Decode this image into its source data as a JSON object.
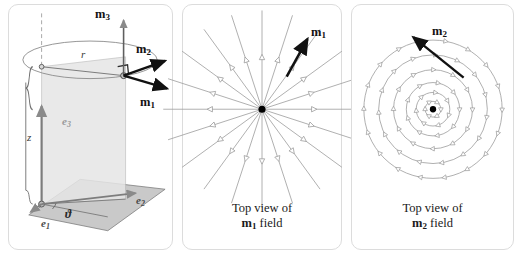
{
  "figure": {
    "background": "#ffffff",
    "panel_border_color": "#dcdcdc"
  },
  "panel1": {
    "name": "cylindrical-coordinate-diagram",
    "labels": {
      "m1": "m",
      "m1_sub": "1",
      "m2": "m",
      "m2_sub": "2",
      "m3": "m",
      "m3_sub": "3",
      "r": "r",
      "z": "z",
      "e1": "e",
      "e1_sub": "1",
      "e2": "e",
      "e2_sub": "2",
      "e3": "e",
      "e3_sub": "3",
      "theta": "ϑ"
    },
    "colors": {
      "vector": "#111111",
      "construction": "#8a8a8a",
      "plane_fill": "#c9c9c9",
      "wall_fill": "#e2e2e2",
      "basis_label": "#4a4a4a",
      "e3_label": "#9a9a9a"
    }
  },
  "panel2": {
    "name": "m1-field-top-view",
    "caption_line1": "Top view of",
    "caption_vector": "m",
    "caption_vector_sub": "1",
    "caption_line2_tail": " field",
    "arrow_label": "m",
    "arrow_label_sub": "1",
    "field_type": "radial",
    "ray_count": 20,
    "ray_color": "#9b9b9b",
    "arrow_color": "#111111",
    "center_dot_color": "#000000"
  },
  "panel3": {
    "name": "m2-field-top-view",
    "caption_line1": "Top view of",
    "caption_vector": "m",
    "caption_vector_sub": "2",
    "caption_line2_tail": " field",
    "arrow_label": "m",
    "arrow_label_sub": "2",
    "field_type": "azimuthal",
    "circle_count": 6,
    "circle_color": "#9b9b9b",
    "arrow_color": "#111111",
    "center_dot_color": "#000000"
  },
  "chart_data": {
    "type": "scatter",
    "xlabel": "",
    "ylabel": "",
    "series": [
      {
        "name": "m1 field (radial, top view)",
        "description": "20 rays emanating outward from the axis, arrowheads pointing away from center",
        "ray_angles_deg": [
          0,
          18,
          36,
          54,
          72,
          90,
          108,
          126,
          144,
          162,
          180,
          198,
          216,
          234,
          252,
          270,
          288,
          306,
          324,
          342
        ]
      },
      {
        "name": "m2 field (azimuthal, top view)",
        "description": "6 concentric circles with tangential arrowheads circulating about the axis",
        "circle_radii_px": [
          8,
          17,
          27,
          40,
          55,
          70
        ]
      }
    ]
  }
}
